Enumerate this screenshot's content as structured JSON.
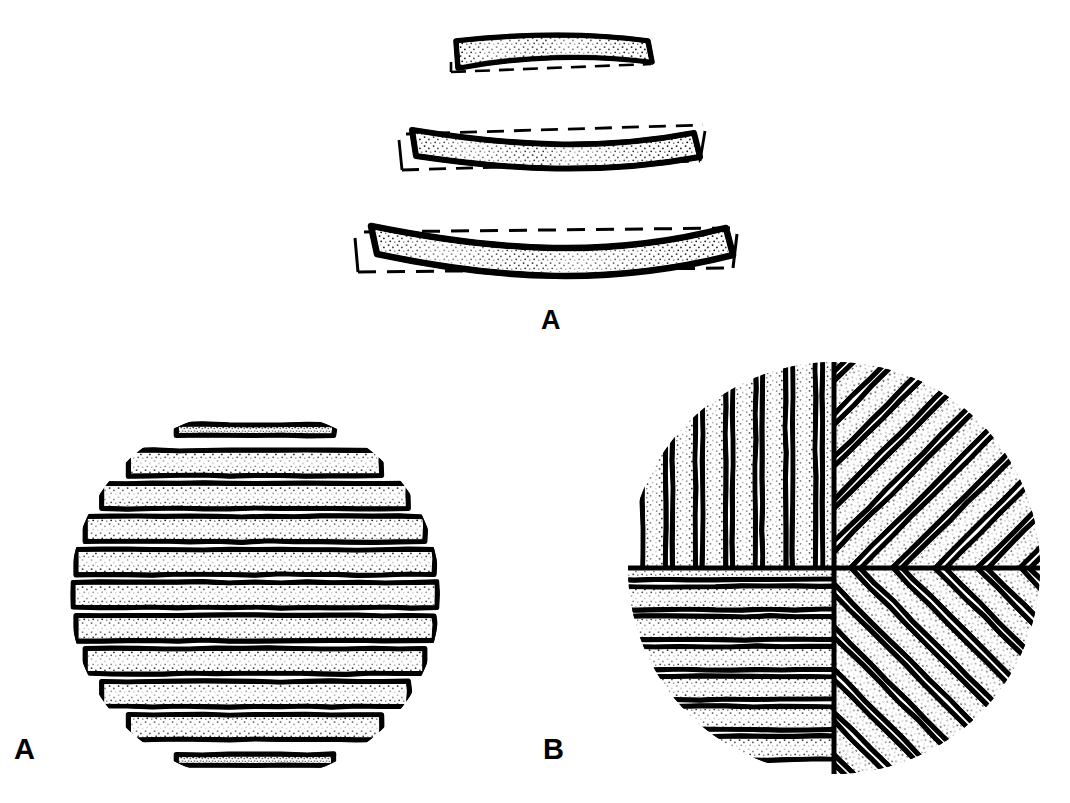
{
  "figure": {
    "background_color": "#ffffff",
    "ink_color": "#000000",
    "width": 1070,
    "height": 803
  },
  "labels": {
    "top_panel": "A",
    "bottom_left_panel": "A",
    "bottom_right_panel": "B"
  },
  "panels": {
    "top": {
      "name": "curved-strip-blanks",
      "label": "A",
      "description": "Three progressively longer curved strips, each shown inside a dashed rectangular blank outline",
      "strip_count": 3,
      "strips": [
        {
          "index": 1,
          "length": 195,
          "height": 34,
          "curve": "bowed",
          "fill": "stipple",
          "outline": "dashed-rectangle"
        },
        {
          "index": 2,
          "length": 290,
          "height": 40,
          "curve": "bowed",
          "fill": "stipple",
          "outline": "dashed-rectangle"
        },
        {
          "index": 3,
          "length": 365,
          "height": 45,
          "curve": "bowed",
          "fill": "stipple",
          "outline": "dashed-rectangle"
        }
      ]
    },
    "bottom_left": {
      "name": "parallel-strip-disc",
      "label": "A",
      "description": "Circular disc built from parallel horizontal strips of graduated length",
      "pattern": "parallel-horizontal",
      "center_x": 255,
      "center_y": 595,
      "radius": 185,
      "band_count": 11,
      "band_pitch": 33,
      "fill": "stipple",
      "edge_style": "ragged"
    },
    "bottom_right": {
      "name": "quadrant-strip-disc",
      "label": "B",
      "description": "Circular disc built from four quadrants of strips laid at differing angles, forming a pinwheel",
      "pattern": "four-quadrant-pinwheel",
      "center_x": 834,
      "center_y": 568,
      "radius": 206,
      "quadrants": [
        {
          "position": "upper-left",
          "strip_angle_deg": 90,
          "note": "vertical strips near axis, 45 degree strips outward"
        },
        {
          "position": "upper-right",
          "strip_angle_deg": 45,
          "note": "diagonal strips running lower-left to upper-right"
        },
        {
          "position": "lower-left",
          "strip_angle_deg": 0,
          "note": "horizontal strips"
        },
        {
          "position": "lower-right",
          "strip_angle_deg": -45,
          "note": "diagonal strips running upper-left to lower-right"
        }
      ],
      "fill": "stipple",
      "edge_style": "ragged"
    }
  }
}
